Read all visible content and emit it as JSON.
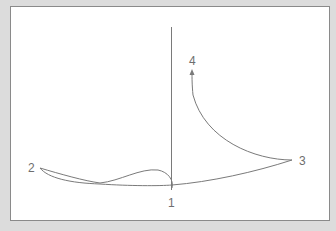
{
  "diagram": {
    "type": "trajectory-diagram",
    "colors": {
      "background": "#dcdcdc",
      "panel": "#ffffff",
      "border": "#8a8a8a",
      "stroke": "#7a7a7a",
      "label": "#6e6e6e"
    },
    "points": [
      {
        "id": "1",
        "label": "1"
      },
      {
        "id": "2",
        "label": "2"
      },
      {
        "id": "3",
        "label": "3"
      },
      {
        "id": "4",
        "label": "4"
      }
    ],
    "elements": [
      {
        "kind": "vertical-axis-line"
      },
      {
        "kind": "curve",
        "from": "2",
        "to": "1",
        "description": "double strand from 2 with a hump loop ending at 1"
      },
      {
        "kind": "curve",
        "from": "1",
        "to": "3",
        "description": "shallow rising line from 1 to 3"
      },
      {
        "kind": "curve",
        "from": "3",
        "to": "4",
        "description": "concave curve rising to 4 with arrowhead"
      }
    ]
  }
}
